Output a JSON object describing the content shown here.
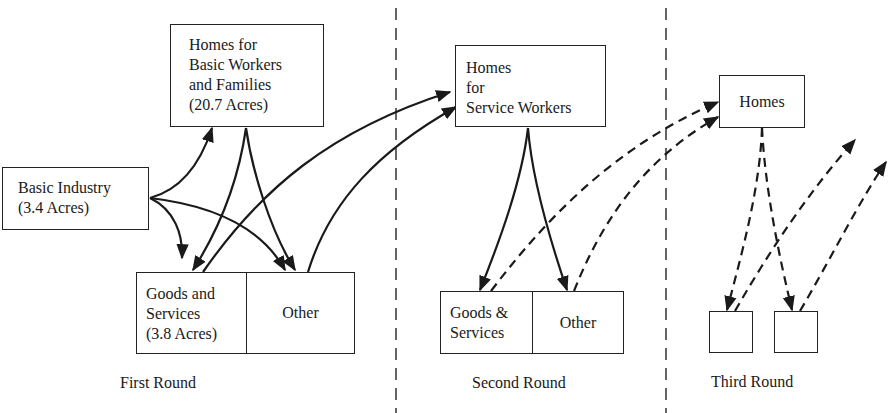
{
  "diagram": {
    "rounds": [
      {
        "label": "First Round",
        "nodes": {
          "homes_basic": [
            "Homes for",
            "Basic Workers",
            "and Families",
            "(20.7 Acres)"
          ],
          "basic_industry": [
            "Basic Industry",
            "(3.4 Acres)"
          ],
          "goods_services": [
            "Goods and",
            "Services",
            "(3.8 Acres)"
          ],
          "other": "Other"
        }
      },
      {
        "label": "Second Round",
        "nodes": {
          "homes_service": [
            "Homes",
            "for",
            "Service Workers"
          ],
          "goods_services": [
            "Goods &",
            "Services"
          ],
          "other": "Other"
        }
      },
      {
        "label": "Third Round",
        "nodes": {
          "homes": "Homes"
        }
      }
    ],
    "edges": [
      {
        "from": "Basic Industry",
        "to": "Homes for Basic Workers and Families",
        "style": "solid"
      },
      {
        "from": "Basic Industry",
        "to": "Goods and Services",
        "style": "solid"
      },
      {
        "from": "Basic Industry",
        "to": "Other (First Round)",
        "style": "solid"
      },
      {
        "from": "Homes for Basic Workers and Families",
        "to": "Goods and Services",
        "style": "solid"
      },
      {
        "from": "Homes for Basic Workers and Families",
        "to": "Other (First Round)",
        "style": "solid"
      },
      {
        "from": "Goods and Services",
        "to": "Homes for Service Workers",
        "style": "solid"
      },
      {
        "from": "Other (First Round)",
        "to": "Homes for Service Workers",
        "style": "solid"
      },
      {
        "from": "Homes for Service Workers",
        "to": "Goods & Services",
        "style": "solid"
      },
      {
        "from": "Homes for Service Workers",
        "to": "Other (Second Round)",
        "style": "solid"
      },
      {
        "from": "Goods & Services",
        "to": "Homes (Third Round)",
        "style": "dashed"
      },
      {
        "from": "Other (Second Round)",
        "to": "Homes (Third Round)",
        "style": "dashed"
      },
      {
        "from": "Homes (Third Round)",
        "to": "Third Round box 1",
        "style": "dashed"
      },
      {
        "from": "Homes (Third Round)",
        "to": "Third Round box 2",
        "style": "dashed"
      },
      {
        "from": "Third Round box 1",
        "to": "next round",
        "style": "dashed"
      },
      {
        "from": "Third Round box 2",
        "to": "next round",
        "style": "dashed"
      }
    ],
    "colors": {
      "line": "#1a1a1a",
      "background": "#ffffff"
    }
  }
}
